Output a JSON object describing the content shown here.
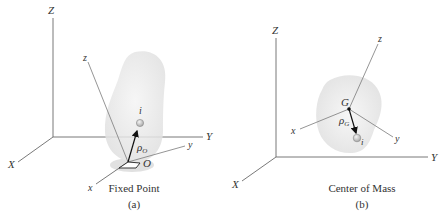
{
  "panels": [
    {
      "id": "a",
      "caption": "Fixed Point",
      "sublabel": "(a)",
      "inertial_axes": {
        "Z": "Z",
        "X": "X",
        "Y": "Y"
      },
      "body_axes": {
        "z": "z",
        "x": "x",
        "y": "y"
      },
      "point_label": "O",
      "particle_label": "i",
      "vector_label": "ρ",
      "vector_subscript": "O"
    },
    {
      "id": "b",
      "caption": "Center of Mass",
      "sublabel": "(b)",
      "inertial_axes": {
        "Z": "Z",
        "X": "X",
        "Y": "Y"
      },
      "body_axes": {
        "z": "z",
        "x": "x",
        "y": "y"
      },
      "point_label": "G",
      "particle_label": "i",
      "vector_label": "ρ",
      "vector_subscript": "G"
    }
  ],
  "colors": {
    "axis": "#6a6a6a",
    "body_fill": "#ececec",
    "shadow": "#d8d8d8",
    "particle": "#c8c8c8",
    "vector": "#111111"
  }
}
